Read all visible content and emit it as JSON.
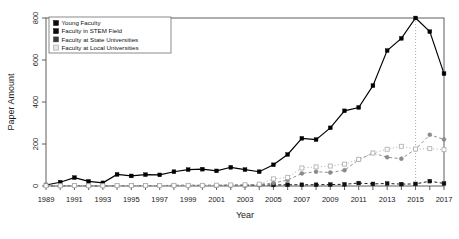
{
  "chart_data": {
    "type": "line",
    "title": "",
    "xlabel": "Year",
    "ylabel": "Paper Amount",
    "xlim": [
      1989,
      2017
    ],
    "ylim": [
      0,
      800
    ],
    "yticks": [
      0,
      200,
      400,
      600,
      800
    ],
    "xticks": [
      1989,
      1991,
      1993,
      1995,
      1997,
      1999,
      2001,
      2003,
      2005,
      2007,
      2009,
      2011,
      2013,
      2015,
      2017
    ],
    "x": [
      1989,
      1990,
      1991,
      1992,
      1993,
      1994,
      1995,
      1996,
      1997,
      1998,
      1999,
      2000,
      2001,
      2002,
      2003,
      2004,
      2005,
      2006,
      2007,
      2008,
      2009,
      2010,
      2011,
      2012,
      2013,
      2014,
      2015,
      2016,
      2017
    ],
    "grid": false,
    "legend_position": "top-left",
    "annotations": [
      {
        "name": "reference-line",
        "type": "vline",
        "x": 2015,
        "style": "dotted",
        "color": "#9a9a9a"
      }
    ],
    "series": [
      {
        "name": "Young Faculty",
        "color": "#000000",
        "marker": "filled-square",
        "linestyle": "solid",
        "values": [
          5,
          18,
          40,
          22,
          15,
          55,
          48,
          54,
          53,
          68,
          78,
          80,
          72,
          89,
          78,
          68,
          101,
          150,
          227,
          221,
          277,
          358,
          374,
          478,
          645,
          703,
          800,
          735,
          535
        ]
      },
      {
        "name": "Faculty in STEM Field",
        "color": "#111111",
        "marker": "filled-square",
        "linestyle": "dashed",
        "values": [
          1,
          1,
          2,
          1,
          1,
          2,
          2,
          2,
          2,
          3,
          3,
          3,
          3,
          4,
          4,
          5,
          5,
          6,
          6,
          6,
          7,
          8,
          14,
          10,
          12,
          9,
          10,
          23,
          12
        ]
      },
      {
        "name": "Faculty at State Universities",
        "color": "#8a8a8a",
        "marker": "filled-circle",
        "linestyle": "dashed",
        "values": [
          1,
          1,
          2,
          1,
          1,
          2,
          2,
          2,
          2,
          3,
          3,
          3,
          3,
          4,
          5,
          8,
          14,
          28,
          60,
          68,
          64,
          75,
          125,
          157,
          137,
          130,
          175,
          244,
          222
        ]
      },
      {
        "name": "Faculty at Local Universities",
        "color": "#b4b4b4",
        "marker": "open-square",
        "linestyle": "dotted",
        "values": [
          1,
          1,
          2,
          1,
          1,
          2,
          2,
          2,
          2,
          3,
          3,
          3,
          4,
          5,
          6,
          9,
          34,
          41,
          86,
          91,
          95,
          104,
          127,
          157,
          175,
          189,
          176,
          178,
          173
        ]
      }
    ]
  },
  "legend": {
    "items": [
      {
        "label": "Young Faculty",
        "swatch": "#0d0d0d",
        "open": false
      },
      {
        "label": "Faculty in STEM Field",
        "swatch": "#0d0d0d",
        "open": false
      },
      {
        "label": "Faculty at State Universities",
        "swatch": "#3a3a3a",
        "open": false
      },
      {
        "label": "Faculty at Local Universities",
        "swatch": "#b8b8b8",
        "open": true
      }
    ]
  }
}
